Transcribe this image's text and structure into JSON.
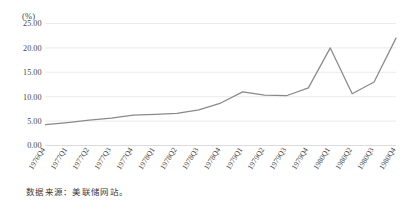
{
  "figure": {
    "unit_label": "(%)",
    "source_note": "数据来源：美联储网站。"
  },
  "chart_data": {
    "type": "line",
    "title": "",
    "subtitle": "",
    "xlabel": "",
    "ylabel": "(%)",
    "unit": "%",
    "grid": true,
    "legend": "none",
    "line_color": "#8a8a8a",
    "grid_color": "#e2e2e2",
    "ylim": [
      0,
      25
    ],
    "ytick_step": 5,
    "ytick_labels": [
      "0.00",
      "5.00",
      "10.00",
      "15.00",
      "20.00",
      "25.00"
    ],
    "ytick_values": [
      0,
      5,
      10,
      15,
      20,
      25
    ],
    "categories": [
      "1976Q4",
      "1977Q1",
      "1977Q2",
      "1977Q3",
      "1977Q4",
      "1978Q1",
      "1978Q2",
      "1978Q3",
      "1978Q4",
      "1979Q1",
      "1979Q2",
      "1979Q3",
      "1979Q4",
      "1980Q1",
      "1980Q2",
      "1980Q3",
      "1980Q4"
    ],
    "series": [
      {
        "name": "利率",
        "values": [
          4.3,
          4.7,
          5.2,
          5.6,
          6.2,
          6.4,
          6.6,
          7.3,
          8.7,
          11.0,
          10.3,
          10.2,
          11.8,
          20.0,
          10.6,
          13.0,
          22.0
        ]
      }
    ]
  }
}
